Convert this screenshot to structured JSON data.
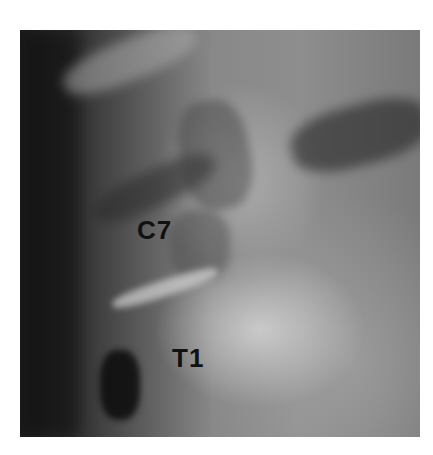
{
  "image": {
    "type": "lateral cervicothoracic spine radiograph",
    "labels": {
      "c7": "C7",
      "t1": "T1"
    }
  }
}
